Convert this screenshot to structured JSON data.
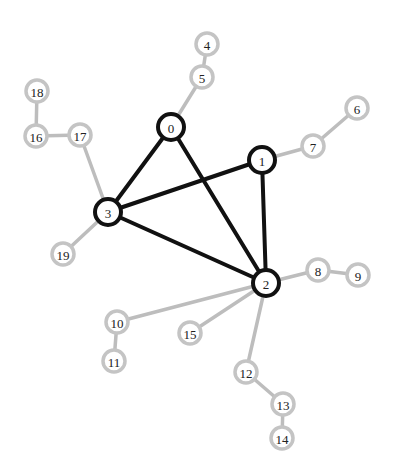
{
  "graph": {
    "colors": {
      "core_stroke": "#111111",
      "leaf_stroke": "#c4c4c4",
      "leaf_edge": "#bdbdbd",
      "node_fill": "#ffffff",
      "label": "#222222"
    },
    "nodes": [
      {
        "id": "0",
        "label": "0",
        "type": "core",
        "x": 171,
        "y": 127
      },
      {
        "id": "1",
        "label": "1",
        "type": "core",
        "x": 262,
        "y": 160
      },
      {
        "id": "2",
        "label": "2",
        "type": "core",
        "x": 266,
        "y": 283
      },
      {
        "id": "3",
        "label": "3",
        "type": "core",
        "x": 108,
        "y": 212
      },
      {
        "id": "4",
        "label": "4",
        "type": "leaf",
        "x": 207,
        "y": 44
      },
      {
        "id": "5",
        "label": "5",
        "type": "leaf",
        "x": 202,
        "y": 77
      },
      {
        "id": "6",
        "label": "6",
        "type": "leaf",
        "x": 357,
        "y": 108
      },
      {
        "id": "7",
        "label": "7",
        "type": "leaf",
        "x": 313,
        "y": 146
      },
      {
        "id": "8",
        "label": "8",
        "type": "leaf",
        "x": 318,
        "y": 270
      },
      {
        "id": "9",
        "label": "9",
        "type": "leaf",
        "x": 358,
        "y": 275
      },
      {
        "id": "10",
        "label": "10",
        "type": "leaf",
        "x": 117,
        "y": 322
      },
      {
        "id": "11",
        "label": "11",
        "type": "leaf",
        "x": 114,
        "y": 361
      },
      {
        "id": "12",
        "label": "12",
        "type": "leaf",
        "x": 246,
        "y": 372
      },
      {
        "id": "13",
        "label": "13",
        "type": "leaf",
        "x": 283,
        "y": 404
      },
      {
        "id": "14",
        "label": "14",
        "type": "leaf",
        "x": 282,
        "y": 438
      },
      {
        "id": "15",
        "label": "15",
        "type": "leaf",
        "x": 190,
        "y": 333
      },
      {
        "id": "16",
        "label": "16",
        "type": "leaf",
        "x": 36,
        "y": 136
      },
      {
        "id": "17",
        "label": "17",
        "type": "leaf",
        "x": 80,
        "y": 135
      },
      {
        "id": "18",
        "label": "18",
        "type": "leaf",
        "x": 37,
        "y": 91
      },
      {
        "id": "19",
        "label": "19",
        "type": "leaf",
        "x": 63,
        "y": 254
      }
    ],
    "edges": [
      {
        "source": "0",
        "target": "3",
        "type": "core"
      },
      {
        "source": "0",
        "target": "2",
        "type": "core"
      },
      {
        "source": "3",
        "target": "1",
        "type": "core"
      },
      {
        "source": "3",
        "target": "2",
        "type": "core"
      },
      {
        "source": "1",
        "target": "2",
        "type": "core"
      },
      {
        "source": "0",
        "target": "5",
        "type": "leaf"
      },
      {
        "source": "5",
        "target": "4",
        "type": "leaf"
      },
      {
        "source": "1",
        "target": "7",
        "type": "leaf"
      },
      {
        "source": "7",
        "target": "6",
        "type": "leaf"
      },
      {
        "source": "2",
        "target": "8",
        "type": "leaf"
      },
      {
        "source": "8",
        "target": "9",
        "type": "leaf"
      },
      {
        "source": "2",
        "target": "10",
        "type": "leaf"
      },
      {
        "source": "10",
        "target": "11",
        "type": "leaf"
      },
      {
        "source": "2",
        "target": "15",
        "type": "leaf"
      },
      {
        "source": "2",
        "target": "12",
        "type": "leaf"
      },
      {
        "source": "12",
        "target": "13",
        "type": "leaf"
      },
      {
        "source": "13",
        "target": "14",
        "type": "leaf"
      },
      {
        "source": "3",
        "target": "17",
        "type": "leaf"
      },
      {
        "source": "17",
        "target": "16",
        "type": "leaf"
      },
      {
        "source": "16",
        "target": "18",
        "type": "leaf"
      },
      {
        "source": "3",
        "target": "19",
        "type": "leaf"
      }
    ],
    "radius": {
      "core": 13,
      "leaf": 11
    }
  }
}
